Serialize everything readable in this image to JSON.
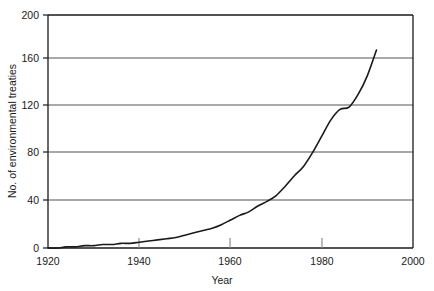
{
  "chart_data": {
    "type": "line",
    "title": "",
    "xlabel": "Year",
    "ylabel": "No. of environmental treaties",
    "xlim": [
      1920,
      2000
    ],
    "ylim": [
      0,
      200
    ],
    "xticks": [
      1920,
      1940,
      1960,
      1980,
      2000
    ],
    "xtick_labels": [
      "1920",
      "1940",
      "1960",
      "1980",
      "2000"
    ],
    "yticks": [
      0,
      40,
      80,
      120,
      160,
      200
    ],
    "ytick_labels": [
      "0",
      "40",
      "80",
      "120",
      "160",
      "200"
    ],
    "grid": "horizontal",
    "legend": "none",
    "series": [
      {
        "name": "No. of environmental treaties",
        "color": "#1a1a1a",
        "x": [
          1920,
          1922,
          1924,
          1926,
          1928,
          1930,
          1932,
          1934,
          1936,
          1938,
          1940,
          1942,
          1944,
          1946,
          1948,
          1950,
          1952,
          1954,
          1956,
          1958,
          1960,
          1962,
          1964,
          1966,
          1968,
          1970,
          1972,
          1974,
          1976,
          1978,
          1980,
          1982,
          1984,
          1986,
          1988,
          1990,
          1992
        ],
        "y": [
          0,
          0,
          1,
          1,
          2,
          2,
          3,
          3,
          4,
          4,
          5,
          6,
          7,
          8,
          9,
          11,
          13,
          15,
          17,
          20,
          24,
          28,
          31,
          36,
          40,
          45,
          53,
          62,
          70,
          82,
          96,
          110,
          119,
          121,
          132,
          148,
          170
        ]
      }
    ]
  },
  "axis": {
    "y_title": "No. of environmental treaties",
    "x_title": "Year"
  }
}
